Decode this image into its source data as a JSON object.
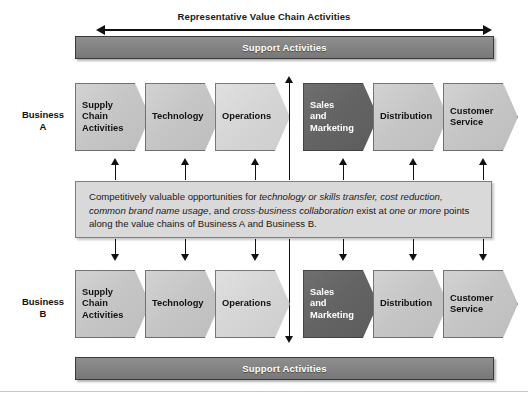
{
  "diagram": {
    "title": "Representative Value Chain Activities",
    "support_bar_top_label": "Support Activities",
    "support_bar_bottom_label": "Support Activities",
    "rows": [
      {
        "id": "business-a",
        "label_line1": "Business",
        "label_line2": "A",
        "stages": [
          {
            "name": "supply-chain-activities",
            "lines": [
              "Supply",
              "Chain",
              "Activities"
            ],
            "shade": "light"
          },
          {
            "name": "technology",
            "lines": [
              "Technology"
            ],
            "shade": "light"
          },
          {
            "name": "operations",
            "lines": [
              "Operations"
            ],
            "shade": "lighter"
          },
          {
            "name": "sales-and-marketing",
            "lines": [
              "Sales",
              "and",
              "Marketing"
            ],
            "shade": "dark"
          },
          {
            "name": "distribution",
            "lines": [
              "Distribution"
            ],
            "shade": "light"
          },
          {
            "name": "customer-service",
            "lines": [
              "Customer",
              "Service"
            ],
            "shade": "light"
          }
        ]
      },
      {
        "id": "business-b",
        "label_line1": "Business",
        "label_line2": "B",
        "stages": [
          {
            "name": "supply-chain-activities",
            "lines": [
              "Supply",
              "Chain",
              "Activities"
            ],
            "shade": "light"
          },
          {
            "name": "technology",
            "lines": [
              "Technology"
            ],
            "shade": "light"
          },
          {
            "name": "operations",
            "lines": [
              "Operations"
            ],
            "shade": "lighter"
          },
          {
            "name": "sales-and-marketing",
            "lines": [
              "Sales",
              "and",
              "Marketing"
            ],
            "shade": "dark"
          },
          {
            "name": "distribution",
            "lines": [
              "Distribution"
            ],
            "shade": "light"
          },
          {
            "name": "customer-service",
            "lines": [
              "Customer",
              "Service"
            ],
            "shade": "light"
          }
        ]
      }
    ],
    "note": {
      "segments": [
        {
          "text": "Competitively valuable opportunities for ",
          "italic": false
        },
        {
          "text": "technology or skills transfer, cost reduction, common brand name usage",
          "italic": true
        },
        {
          "text": ", and ",
          "italic": false
        },
        {
          "text": "cross-business collaboration",
          "italic": true
        },
        {
          "text": " exist at ",
          "italic": false
        },
        {
          "text": "one or more",
          "italic": true
        },
        {
          "text": " points along the value chains of Business A and Business B.",
          "italic": false
        }
      ],
      "plain_text": "Competitively valuable opportunities for technology or skills transfer, cost reduction, common brand name usage, and cross-business collaboration exist at one or more points along the value chains of Business A and Business B."
    },
    "colors": {
      "support_bar": "#828282",
      "chevron_light": "#c6c6c6",
      "chevron_lighter": "#d6d6d6",
      "chevron_dark": "#646464",
      "note_bg": "#d9d9d9",
      "outline": "#3a3a3a",
      "arrow": "#111111"
    }
  }
}
